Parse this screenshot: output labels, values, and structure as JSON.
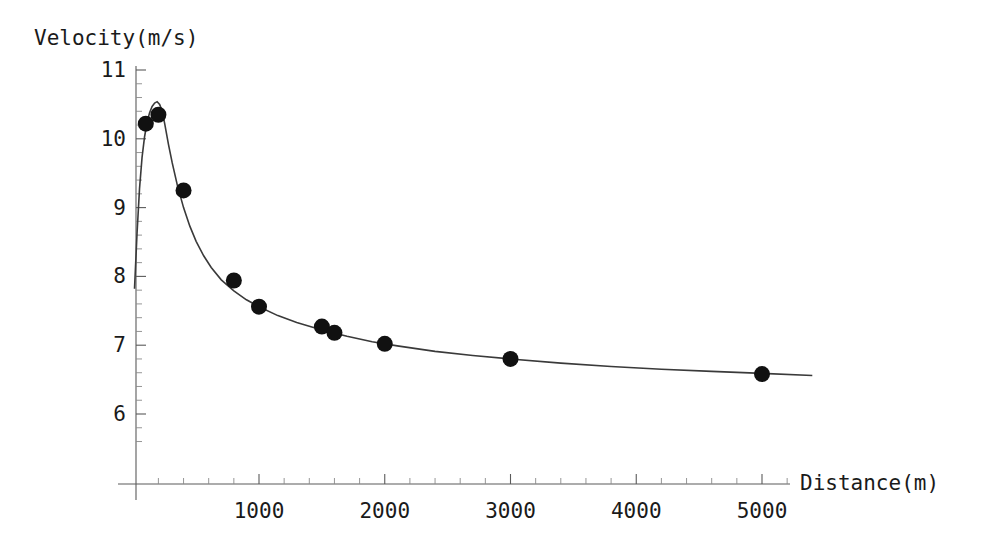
{
  "chart_data": {
    "type": "scatter",
    "title": "",
    "subtitle": "",
    "xlabel": "Distance(m)",
    "ylabel": "Velocity(m/s)",
    "xlim": [
      0,
      5400
    ],
    "ylim": [
      5.6,
      11.15
    ],
    "xticks": [
      1000,
      2000,
      3000,
      4000,
      5000
    ],
    "xtick_labels": [
      "1000",
      "2000",
      "3000",
      "4000",
      "5000"
    ],
    "yticks": [
      6,
      7,
      8,
      9,
      10,
      11
    ],
    "ytick_labels": [
      "6",
      "7",
      "8",
      "9",
      "10",
      "11"
    ],
    "x_minor_tick_step": 200,
    "y_minor_tick_step": 0.2,
    "grid": false,
    "legend": null,
    "point_color": "#111111",
    "curve_color": "#3a3a3a",
    "axis_color": "#5a5a5a",
    "marker": "filled-circle",
    "marker_radius_px": 8,
    "series": [
      {
        "name": "Measured data",
        "type": "scatter",
        "x": [
          100,
          200,
          400,
          800,
          1000,
          1500,
          1600,
          2000,
          3000,
          5000
        ],
        "y": [
          10.22,
          10.35,
          9.25,
          7.94,
          7.56,
          7.27,
          7.18,
          7.02,
          6.8,
          6.58
        ]
      },
      {
        "name": "Fitted curve",
        "type": "line",
        "x": [
          10,
          30,
          50,
          70,
          90,
          110,
          130,
          150,
          170,
          190,
          210,
          230,
          250,
          280,
          310,
          350,
          400,
          450,
          500,
          560,
          620,
          700,
          800,
          900,
          1000,
          1150,
          1300,
          1500,
          1700,
          1900,
          2100,
          2400,
          2700,
          3000,
          3400,
          3800,
          4200,
          4600,
          5000,
          5400
        ],
        "y": [
          7.82,
          8.62,
          9.28,
          9.73,
          10.03,
          10.24,
          10.38,
          10.47,
          10.52,
          10.54,
          10.5,
          10.4,
          10.22,
          9.92,
          9.65,
          9.33,
          9.0,
          8.73,
          8.51,
          8.3,
          8.13,
          7.95,
          7.79,
          7.66,
          7.56,
          7.43,
          7.33,
          7.22,
          7.13,
          7.05,
          6.99,
          6.91,
          6.85,
          6.8,
          6.74,
          6.69,
          6.65,
          6.62,
          6.59,
          6.56
        ]
      }
    ]
  },
  "axes": {
    "y_axis_title": "Velocity(m/s)",
    "x_axis_title": "Distance(m)"
  }
}
